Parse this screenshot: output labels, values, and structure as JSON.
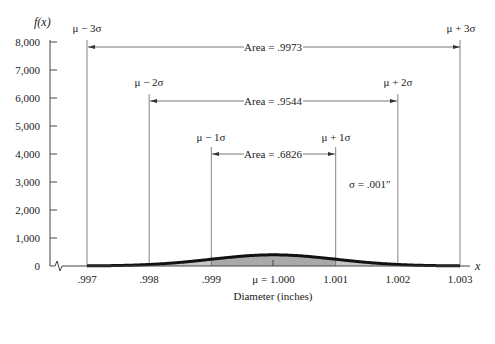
{
  "chart_data": {
    "type": "area",
    "title": "",
    "xlabel": "Diameter (inches)",
    "ylabel": "f(x)",
    "x_axis_var": "x",
    "mean": 1.0,
    "sigma": 0.001,
    "xlim": [
      0.997,
      1.003
    ],
    "ylim": [
      0,
      8000
    ],
    "x_ticks": [
      0.997,
      0.998,
      0.999,
      1.0,
      1.001,
      1.002,
      1.003
    ],
    "x_tick_labels": [
      ".997",
      ".998",
      ".999",
      "μ = 1.000",
      "1.001",
      "1.002",
      "1.003"
    ],
    "y_ticks": [
      0,
      1000,
      2000,
      3000,
      4000,
      5000,
      6000,
      7000,
      8000
    ],
    "y_tick_labels": [
      "0",
      "1,000",
      "2,000",
      "3,000",
      "4,000",
      "5,000",
      "6,000",
      "7,000",
      "8,000"
    ],
    "grid": false,
    "curve": "normal density, peak ≈ 3989 at x = 1.000",
    "shaded_regions": [
      {
        "from": 0.999,
        "to": 1.001,
        "label": "Area = .6826",
        "shade": "dark"
      },
      {
        "from": 0.998,
        "to": 1.002,
        "label": "Area = .9544",
        "shade": "medium"
      },
      {
        "from": 0.997,
        "to": 1.003,
        "label": "Area = .9973",
        "shade": "light"
      }
    ],
    "annotations": [
      "μ − 3σ",
      "μ + 3σ",
      "μ − 2σ",
      "μ + 2σ",
      "μ − 1σ",
      "μ + 1σ",
      "σ = .001″"
    ]
  },
  "labels": {
    "ylabel": "f(x)",
    "xvar": "x",
    "xlabel": "Diameter (inches)",
    "sigma_note": "σ = .001″",
    "area3": "Area = .9973",
    "area2": "Area = .9544",
    "area1": "Area = .6826",
    "m3": "μ − 3σ",
    "p3": "μ + 3σ",
    "m2": "μ − 2σ",
    "p2": "μ + 2σ",
    "m1": "μ − 1σ",
    "p1": "μ + 1σ"
  },
  "yticks": [
    "0",
    "1,000",
    "2,000",
    "3,000",
    "4,000",
    "5,000",
    "6,000",
    "7,000",
    "8,000"
  ],
  "xticks": [
    ".997",
    ".998",
    ".999",
    "μ = 1.000",
    "1.001",
    "1.002",
    "1.003"
  ],
  "colors": {
    "dark": "#a9a9a9",
    "medium": "#c6c6c6",
    "light": "#e3e3e3",
    "curve": "#111111",
    "line": "#555555"
  }
}
